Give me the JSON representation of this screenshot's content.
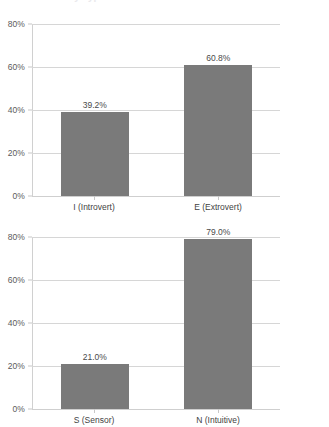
{
  "page": {
    "clipped_title_fragment": "Personality Type Distribution",
    "background_color": "#ffffff"
  },
  "style": {
    "bar_color": "#7a7a7a",
    "gridline_color": "#d6d6d6",
    "axis_color": "#d0d0d0",
    "label_color": "#3f3f3f",
    "tick_label_color": "#5b5b5b"
  },
  "chart_data": [
    {
      "id": "chart-ie",
      "type": "bar",
      "title": "",
      "xlabel": "",
      "ylabel": "",
      "categories": [
        "I (Introvert)",
        "E (Extrovert)"
      ],
      "values": [
        39.2,
        60.8
      ],
      "value_labels": [
        "39.2%",
        "60.8%"
      ],
      "ylim": [
        0,
        80
      ],
      "yticks": [
        0,
        20,
        40,
        60,
        80
      ],
      "ytick_labels": [
        "0%",
        "20%",
        "40%",
        "60%",
        "80%"
      ],
      "grid": true,
      "legend": false,
      "units": "percent"
    },
    {
      "id": "chart-sn",
      "type": "bar",
      "title": "",
      "xlabel": "",
      "ylabel": "",
      "categories": [
        "S (Sensor)",
        "N (Intuitive)"
      ],
      "values": [
        21.0,
        79.0
      ],
      "value_labels": [
        "21.0%",
        "79.0%"
      ],
      "ylim": [
        0,
        80
      ],
      "yticks": [
        0,
        20,
        40,
        60,
        80
      ],
      "ytick_labels": [
        "0%",
        "20%",
        "40%",
        "60%",
        "80%"
      ],
      "grid": true,
      "legend": false,
      "units": "percent"
    }
  ]
}
